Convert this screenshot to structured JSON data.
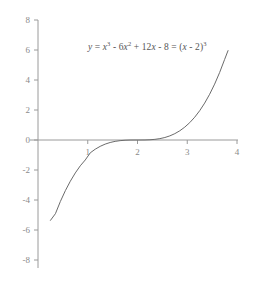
{
  "chart_data": {
    "type": "line",
    "title": "",
    "annotation": "y = x³ - 6x² + 12x - 8 = (x - 2)³",
    "equation_parts": {
      "lhs_var": "y",
      "equals_1": "=",
      "term1_base": "x",
      "term1_exp": "3",
      "term2_sign": "-",
      "term2_coeff": "6",
      "term2_base": "x",
      "term2_exp": "2",
      "term3_sign": "+",
      "term3_coeff": "12",
      "term3_base": "x",
      "term4_sign": "-",
      "term4_const": "8",
      "equals_2": "=",
      "factored_open": "(",
      "factored_var": "x",
      "factored_sign": "-",
      "factored_const": "2",
      "factored_close": ")",
      "factored_exp": "3"
    },
    "xlabel": "",
    "ylabel": "",
    "xlim": [
      0,
      4
    ],
    "ylim": [
      -8,
      8
    ],
    "xticks": [
      1,
      2,
      3,
      4
    ],
    "yticks": [
      8,
      6,
      4,
      2,
      0,
      -2,
      -4,
      -6,
      -8
    ],
    "xtick_labels": [
      "1",
      "2",
      "3",
      "4"
    ],
    "ytick_labels": [
      "8",
      "6",
      "4",
      "2",
      "0",
      "-2",
      "-4",
      "-6",
      "-8"
    ],
    "grid": false,
    "legend": null,
    "series": [
      {
        "name": "y = (x - 2)^3",
        "x": [
          0.25,
          0.35,
          0.45,
          0.55,
          0.65,
          0.75,
          0.85,
          0.95,
          1.05,
          1.15,
          1.25,
          1.35,
          1.45,
          1.55,
          1.65,
          1.75,
          1.85,
          1.95,
          2.05,
          2.15,
          2.25,
          2.35,
          2.45,
          2.55,
          2.65,
          2.75,
          2.85,
          2.95,
          3.05,
          3.15,
          3.25,
          3.35,
          3.45,
          3.55,
          3.65,
          3.75,
          3.82
        ],
        "y": [
          -5.359,
          -4.913,
          -4.096,
          -3.375,
          -2.746,
          -2.197,
          -1.72,
          -1.331,
          -0.857,
          -0.614,
          -0.422,
          -0.274,
          -0.166,
          -0.091,
          -0.043,
          -0.016,
          -0.003,
          -0.0001,
          0.0001,
          0.003,
          0.016,
          0.043,
          0.091,
          0.166,
          0.274,
          0.422,
          0.614,
          0.857,
          1.158,
          1.521,
          1.953,
          2.46,
          3.049,
          3.724,
          4.492,
          5.359,
          5.96
        ]
      }
    ],
    "axes": {
      "x_axis_color": "#9a9a9a",
      "y_axis_color": "#9a9a9a",
      "curve_color": "#6b6b6b",
      "curve_width": 1
    },
    "colors": {
      "background": "#ffffff",
      "text": "#8a8a8a",
      "equation_text": "#555555"
    }
  },
  "figure": {
    "width": 253,
    "height": 281
  }
}
